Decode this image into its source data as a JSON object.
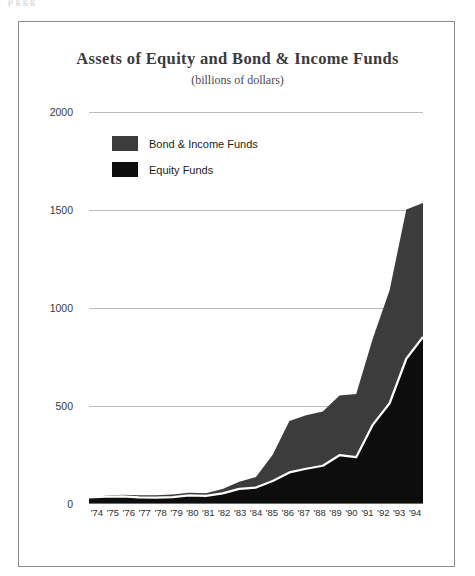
{
  "page": {
    "top_clipped_text": "p            g    g   g"
  },
  "figure": {
    "title": "Assets of Equity and Bond & Income Funds",
    "subtitle": "(billions of dollars)"
  },
  "legend": {
    "position": "inside-top-left",
    "items": [
      {
        "label": "Bond & Income Funds",
        "color": "#3c3c3c",
        "name": "bond-income-funds"
      },
      {
        "label": "Equity Funds",
        "color": "#0d0d0d",
        "name": "equity-funds"
      }
    ]
  },
  "axes": {
    "y_ticks": [
      "2000",
      "1500",
      "1000",
      "500",
      "0"
    ],
    "y_tick_values": [
      2000,
      1500,
      1000,
      500,
      0
    ],
    "x_ticks": [
      "'74",
      "'75",
      "'76",
      "'77",
      "'78",
      "'79",
      "'80",
      "'81",
      "'82",
      "'83",
      "'84",
      "'85",
      "'86",
      "'87",
      "'88",
      "'89",
      "'90",
      "'91",
      "'92",
      "'93",
      "'94"
    ]
  },
  "chart_data": {
    "type": "area",
    "stacked": true,
    "title": "Assets of Equity and Bond & Income Funds",
    "subtitle": "(billions of dollars)",
    "xlabel": "",
    "ylabel": "",
    "ylim": [
      0,
      2000
    ],
    "ytick_step": 500,
    "grid": true,
    "legend_position": "inside-top-left",
    "categories": [
      "'74",
      "'75",
      "'76",
      "'77",
      "'78",
      "'79",
      "'80",
      "'81",
      "'82",
      "'83",
      "'84",
      "'85",
      "'86",
      "'87",
      "'88",
      "'89",
      "'90",
      "'91",
      "'92",
      "'93",
      "'94"
    ],
    "x": [
      1974,
      1975,
      1976,
      1977,
      1978,
      1979,
      1980,
      1981,
      1982,
      1983,
      1984,
      1985,
      1986,
      1987,
      1988,
      1989,
      1990,
      1991,
      1992,
      1993,
      1994
    ],
    "series": [
      {
        "name": "Equity Funds",
        "color": "#0d0d0d",
        "values": [
          34,
          37,
          39,
          34,
          33,
          35,
          44,
          41,
          54,
          77,
          84,
          117,
          161,
          180,
          195,
          249,
          239,
          405,
          514,
          741,
          852
        ]
      },
      {
        "name": "Bond & Income Funds",
        "color": "#3c3c3c",
        "values": [
          1,
          5,
          8,
          11,
          12,
          14,
          14,
          14,
          23,
          36,
          54,
          134,
          263,
          273,
          277,
          304,
          322,
          441,
          577,
          761,
          684
        ]
      }
    ],
    "totals": [
      35,
      42,
      47,
      45,
      45,
      49,
      58,
      55,
      77,
      113,
      138,
      251,
      424,
      453,
      472,
      553,
      561,
      846,
      1091,
      1502,
      1536
    ],
    "separator_line_color": "#ffffff"
  }
}
